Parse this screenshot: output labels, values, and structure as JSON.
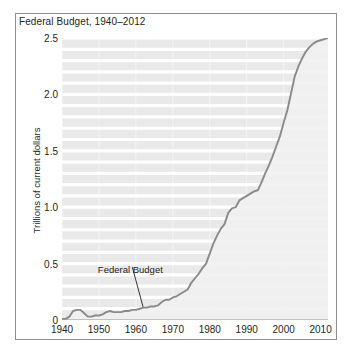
{
  "figure": {
    "title": "Federal Budget, 1940–2012",
    "y_axis_title": "Trillions of current dollars",
    "line_color": "#8a8a8a",
    "plot_background": "#e9e9e9",
    "gridline_color": "#ffffff",
    "frame_color": "#8d8d8d",
    "text_color": "#231f20"
  },
  "annotation": {
    "label": "Federal Budget",
    "point_x": 1962,
    "point_y": 0.11,
    "label_x": 1958.5,
    "label_y": 0.45
  },
  "chart_data": {
    "type": "line",
    "title": "Federal Budget, 1940–2012",
    "xlabel": "",
    "ylabel": "Trillions of current dollars",
    "xlim": [
      1940,
      2012
    ],
    "ylim": [
      0,
      2.5
    ],
    "xticks": [
      1940,
      1950,
      1960,
      1970,
      1980,
      1990,
      2000,
      2010
    ],
    "yticks": [
      0,
      0.5,
      1.0,
      1.5,
      2.0,
      2.5
    ],
    "ytick_labels": [
      "0",
      "0.5",
      "1.0",
      "1.5",
      "2.0",
      "2.5"
    ],
    "xtick_labels": [
      "1940",
      "1950",
      "1960",
      "1970",
      "1980",
      "1990",
      "2000",
      "2010"
    ],
    "grid": "horizontal minor white gridlines every 0.1 trillion",
    "legend": "none",
    "series": [
      {
        "name": "Federal Budget",
        "x": [
          1940,
          1941,
          1942,
          1943,
          1944,
          1945,
          1946,
          1947,
          1948,
          1949,
          1950,
          1951,
          1952,
          1953,
          1954,
          1955,
          1956,
          1957,
          1958,
          1959,
          1960,
          1961,
          1962,
          1963,
          1964,
          1965,
          1966,
          1967,
          1968,
          1969,
          1970,
          1971,
          1972,
          1973,
          1974,
          1975,
          1976,
          1977,
          1978,
          1979,
          1980,
          1981,
          1982,
          1983,
          1984,
          1985,
          1986,
          1987,
          1988,
          1989,
          1990,
          1991,
          1992,
          1993,
          1994,
          1995,
          1996,
          1997,
          1998,
          1999,
          2000,
          2001,
          2002,
          2003,
          2004,
          2005,
          2006,
          2007,
          2008,
          2009,
          2010,
          2011,
          2012
        ],
        "y": [
          0.01,
          0.01,
          0.03,
          0.08,
          0.09,
          0.09,
          0.06,
          0.03,
          0.03,
          0.04,
          0.04,
          0.05,
          0.07,
          0.08,
          0.07,
          0.07,
          0.07,
          0.08,
          0.08,
          0.09,
          0.09,
          0.1,
          0.11,
          0.11,
          0.12,
          0.12,
          0.13,
          0.16,
          0.18,
          0.18,
          0.2,
          0.21,
          0.23,
          0.25,
          0.27,
          0.33,
          0.37,
          0.41,
          0.46,
          0.5,
          0.59,
          0.68,
          0.75,
          0.81,
          0.85,
          0.95,
          0.99,
          1.0,
          1.06,
          1.14,
          1.25,
          1.32,
          1.38,
          1.41,
          1.46,
          1.52,
          1.56,
          1.6,
          1.65,
          1.7,
          1.79,
          1.86,
          2.01,
          2.16,
          2.29,
          2.47,
          2.66,
          2.73,
          2.98,
          3.52,
          3.46,
          3.6,
          3.54
        ],
        "y_displayed": [
          0.01,
          0.01,
          0.03,
          0.08,
          0.09,
          0.09,
          0.06,
          0.03,
          0.03,
          0.04,
          0.04,
          0.05,
          0.07,
          0.08,
          0.07,
          0.07,
          0.07,
          0.08,
          0.08,
          0.09,
          0.09,
          0.1,
          0.11,
          0.11,
          0.12,
          0.12,
          0.13,
          0.16,
          0.18,
          0.18,
          0.2,
          0.21,
          0.23,
          0.25,
          0.27,
          0.33,
          0.37,
          0.41,
          0.46,
          0.5,
          0.59,
          0.68,
          0.75,
          0.81,
          0.85,
          0.95,
          0.99,
          1.0,
          1.06,
          1.08,
          1.1,
          1.12,
          1.14,
          1.15,
          1.22,
          1.3,
          1.37,
          1.45,
          1.54,
          1.63,
          1.75,
          1.86,
          2.01,
          2.16,
          2.25,
          2.32,
          2.38,
          2.42,
          2.45,
          2.47,
          2.48,
          2.49,
          2.5
        ]
      }
    ]
  }
}
